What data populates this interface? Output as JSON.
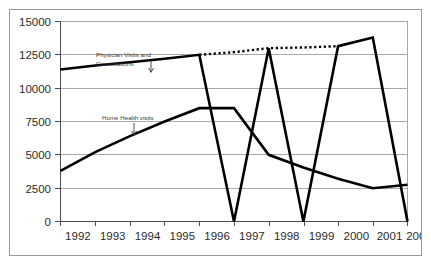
{
  "chart_data": {
    "type": "line",
    "title": "",
    "xlabel": "",
    "ylabel": "",
    "categories": [
      "1992",
      "1993",
      "1994",
      "1995",
      "1996",
      "1997",
      "1998",
      "1999",
      "2000",
      "2001",
      "2002"
    ],
    "ylim": [
      0,
      15000
    ],
    "yticks": [
      "0",
      "2500",
      "5000",
      "7500",
      "10000",
      "12500",
      "15000"
    ],
    "ytick_values": [
      0,
      2500,
      5000,
      7500,
      10000,
      12500,
      15000
    ],
    "grid": true,
    "legend": "none",
    "series": [
      {
        "name": "Physician Visits and Consultations",
        "style": "solid",
        "values": [
          11400,
          11700,
          11950,
          12200,
          12500,
          0,
          13000,
          0,
          13150,
          13800,
          0
        ]
      },
      {
        "name": "Home Health visits",
        "style": "solid",
        "values": [
          3800,
          5200,
          6400,
          7500,
          8500,
          8500,
          5000,
          4050,
          3200,
          2500,
          2750
        ]
      },
      {
        "name": "Physician Visits trendline",
        "style": "dotted",
        "x": [
          "1996",
          "1997",
          "1998",
          "1999",
          "2000"
        ],
        "values": [
          12500,
          12700,
          13000,
          13050,
          13150
        ]
      }
    ],
    "annotations": [
      {
        "id": "physician-annotation",
        "text_line1": "Physician Visits and",
        "text_line2": "Consultations",
        "target_series": "Physician Visits and Consultations"
      },
      {
        "id": "home-health-annotation",
        "text_line1": "Home Health visits",
        "text_line2": "",
        "target_series": "Home Health visits"
      }
    ],
    "colors": {
      "series_line": "#000000",
      "gridline": "#a8a8a8",
      "axis": "#4d4d4d",
      "frame_border": "#9a9a9a",
      "background": "#ffffff",
      "tick_label": "#2b2b2b",
      "annotation_text": "#3a3a3a"
    }
  }
}
